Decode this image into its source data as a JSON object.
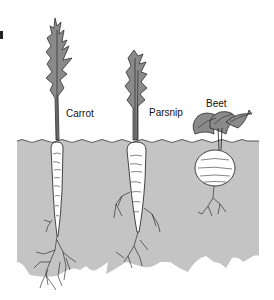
{
  "diagram": {
    "title": "",
    "colors": {
      "soil": "#c4c4c4",
      "foliage": "#8a8a8a",
      "outline": "#1a1a1a",
      "root_fill": "#ffffff",
      "background": "#ffffff"
    },
    "plants": [
      {
        "name": "carrot",
        "label": "Carrot"
      },
      {
        "name": "parsnip",
        "label": "Parsnip"
      },
      {
        "name": "beet",
        "label": "Beet"
      }
    ]
  }
}
